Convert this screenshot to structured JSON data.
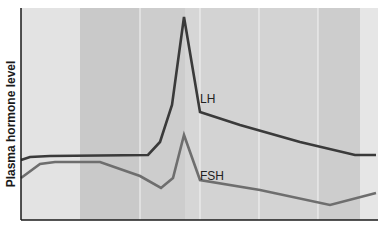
{
  "chart_data": {
    "type": "line",
    "title": "",
    "xlabel": "",
    "ylabel": "Plasma hormone level",
    "grid": false,
    "legend": "inline labels",
    "x_ticks": [],
    "y_ticks": [],
    "background_bands": [
      {
        "x0": 21,
        "x1": 80,
        "color": "#e3e3e3"
      },
      {
        "x0": 80,
        "x1": 140,
        "color": "#c9c9c9"
      },
      {
        "x0": 140,
        "x1": 185,
        "color": "#cdcdcd"
      },
      {
        "x0": 185,
        "x1": 200,
        "color": "#d6d6d6"
      },
      {
        "x0": 200,
        "x1": 259,
        "color": "#d3d3d3"
      },
      {
        "x0": 259,
        "x1": 318,
        "color": "#d3d3d3"
      },
      {
        "x0": 318,
        "x1": 360,
        "color": "#cdcdcd"
      },
      {
        "x0": 360,
        "x1": 378,
        "color": "#e6e6e6"
      }
    ],
    "separators_x": [
      140,
      200,
      259,
      318
    ],
    "series": [
      {
        "name": "LH",
        "color": "#3a3a3a",
        "points": [
          [
            21,
            160
          ],
          [
            30,
            157
          ],
          [
            50,
            156
          ],
          [
            148,
            155
          ],
          [
            160,
            142
          ],
          [
            172,
            105
          ],
          [
            184,
            17
          ],
          [
            200,
            112
          ],
          [
            240,
            125
          ],
          [
            300,
            142
          ],
          [
            355,
            155
          ],
          [
            376,
            155
          ]
        ]
      },
      {
        "name": "FSH",
        "color": "#6e6e6e",
        "points": [
          [
            21,
            178
          ],
          [
            40,
            164
          ],
          [
            55,
            162
          ],
          [
            100,
            162
          ],
          [
            140,
            176
          ],
          [
            161,
            188
          ],
          [
            173,
            178
          ],
          [
            184,
            135
          ],
          [
            200,
            180
          ],
          [
            260,
            190
          ],
          [
            330,
            205
          ],
          [
            376,
            193
          ]
        ]
      }
    ],
    "annotations": [
      {
        "text": "LH",
        "x": 200,
        "y": 103
      },
      {
        "text": "FSH",
        "x": 200,
        "y": 180
      }
    ]
  },
  "labels": {
    "ylabel": "Plasma hormone level",
    "lh": "LH",
    "fsh": "FSH"
  }
}
